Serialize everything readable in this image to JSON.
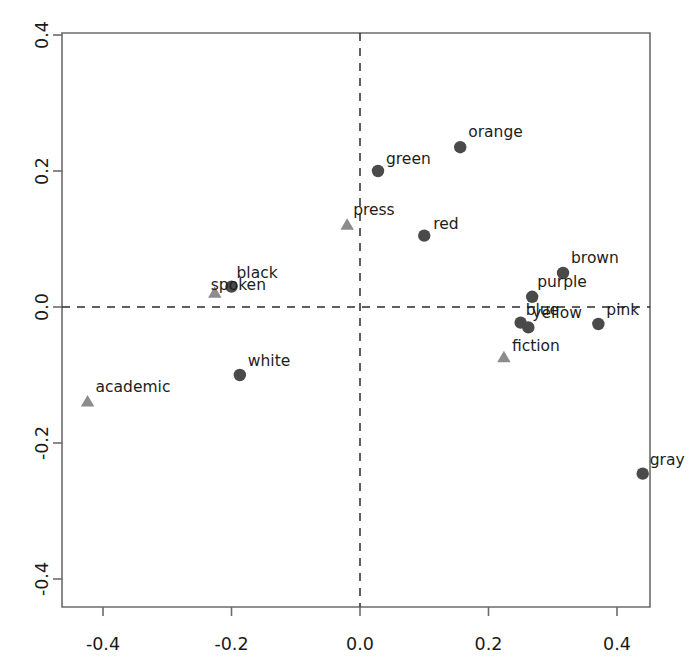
{
  "chart_data": {
    "type": "scatter",
    "title": "",
    "subtitle": "",
    "xlabel": "",
    "ylabel": "",
    "xlim": [
      -0.47,
      0.465
    ],
    "ylim": [
      -0.45,
      0.445
    ],
    "xticks": [
      -0.4,
      -0.2,
      0.0,
      0.2,
      0.4
    ],
    "xtick_labels": [
      "-0.4",
      "-0.2",
      "0.0",
      "0.2",
      "0.4"
    ],
    "yticks": [
      -0.4,
      -0.2,
      0.0,
      0.2,
      0.4
    ],
    "ytick_labels": [
      "-0.4",
      "-0.2",
      "0.0",
      "0.2",
      "0.4"
    ],
    "grid": false,
    "legend": false,
    "reference_lines": [
      {
        "axis": "horizontal",
        "value": 0.0,
        "style": "dashed"
      },
      {
        "axis": "vertical",
        "value": 0.0,
        "style": "dashed"
      }
    ],
    "series": [
      {
        "name": "colour-terms",
        "marker": "circle",
        "color": "#4a4a4a",
        "points": [
          {
            "label": "black",
            "x": -0.2,
            "y": 0.03,
            "label_dx": 5,
            "label_dy": -9
          },
          {
            "label": "green",
            "x": 0.028,
            "y": 0.2,
            "label_dx": 8,
            "label_dy": -7
          },
          {
            "label": "orange",
            "x": 0.156,
            "y": 0.235,
            "label_dx": 8,
            "label_dy": -10
          },
          {
            "label": "red",
            "x": 0.1,
            "y": 0.105,
            "label_dx": 9,
            "label_dy": -7
          },
          {
            "label": "brown",
            "x": 0.316,
            "y": 0.05,
            "label_dx": 8,
            "label_dy": -10
          },
          {
            "label": "purple",
            "x": 0.268,
            "y": 0.015,
            "label_dx": 5,
            "label_dy": -10
          },
          {
            "label": "blue",
            "x": 0.25,
            "y": -0.023,
            "label_dx": 5,
            "label_dy": -8
          },
          {
            "label": "yellow",
            "x": 0.262,
            "y": -0.03,
            "label_dx": 4,
            "label_dy": -9
          },
          {
            "label": "pink",
            "x": 0.371,
            "y": -0.025,
            "label_dx": 8,
            "label_dy": -9
          },
          {
            "label": "white",
            "x": -0.187,
            "y": -0.1,
            "label_dx": 8,
            "label_dy": -9
          },
          {
            "label": "gray",
            "x": 0.44,
            "y": -0.245,
            "label_dx": 7,
            "label_dy": -9
          }
        ]
      },
      {
        "name": "register-terms",
        "marker": "triangle",
        "color": "#8c8c8c",
        "points": [
          {
            "label": "spoken",
            "x": -0.226,
            "y": 0.02,
            "label_dx": -4,
            "label_dy": -3
          },
          {
            "label": "press",
            "x": -0.02,
            "y": 0.12,
            "label_dx": 6,
            "label_dy": -10
          },
          {
            "label": "fiction",
            "x": 0.224,
            "y": -0.075,
            "label_dx": 8,
            "label_dy": -7
          },
          {
            "label": "academic",
            "x": -0.424,
            "y": -0.14,
            "label_dx": 8,
            "label_dy": -10
          }
        ]
      }
    ]
  },
  "colors": {
    "circle_marker": "#4a4a4a",
    "triangle_marker": "#8c8c8c",
    "axis": "#6b6b6b",
    "dashed_reference": "#2b2b2b",
    "text": "#1a1a1a",
    "background": "#ffffff"
  }
}
